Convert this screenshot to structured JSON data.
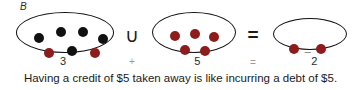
{
  "figure": {
    "set_label": "B",
    "caption": "Having a credit of $5 taken away is like incurring a debt of $5.",
    "operators": {
      "union": "∪",
      "equals": "=",
      "plus_small": "+",
      "equals_small": "="
    },
    "labels": {
      "first": "3",
      "second_sign": "¯",
      "second_value": "5",
      "result_sign": "¯",
      "result_value": "2"
    },
    "colors": {
      "black_dot": "#111111",
      "red_dot": "#8e1c1c",
      "outline": "#111111",
      "background": "#ffffff"
    },
    "sets": [
      {
        "name": "set-b",
        "label": "3",
        "black_count": 5,
        "red_count": 3,
        "dots": [
          {
            "color": "black",
            "x": 22,
            "y": 25,
            "r": 5.4
          },
          {
            "color": "black",
            "x": 44,
            "y": 19,
            "r": 5.4
          },
          {
            "color": "black",
            "x": 66,
            "y": 19,
            "r": 5.4
          },
          {
            "color": "black",
            "x": 86,
            "y": 26,
            "r": 5.4
          },
          {
            "color": "black",
            "x": 55,
            "y": 38,
            "r": 5.4
          },
          {
            "color": "red",
            "x": 32,
            "y": 40,
            "r": 5.4
          },
          {
            "color": "red",
            "x": 78,
            "y": 40,
            "r": 5.4
          },
          {
            "color": "red",
            "x": 55,
            "y": 38,
            "r": 0
          }
        ]
      },
      {
        "name": "set-negative-five",
        "label": "5",
        "black_count": 0,
        "red_count": 5,
        "dots": [
          {
            "color": "red",
            "x": 22,
            "y": 23,
            "r": 5.4
          },
          {
            "color": "red",
            "x": 42,
            "y": 21,
            "r": 5.4
          },
          {
            "color": "red",
            "x": 61,
            "y": 24,
            "r": 5.4
          },
          {
            "color": "red",
            "x": 32,
            "y": 37,
            "r": 5.4
          },
          {
            "color": "red",
            "x": 52,
            "y": 38,
            "r": 5.4
          }
        ]
      },
      {
        "name": "set-result",
        "label": "2",
        "black_count": 0,
        "red_count": 2,
        "dots": [
          {
            "color": "red",
            "x": 20,
            "y": 30,
            "r": 5.0
          },
          {
            "color": "red",
            "x": 47,
            "y": 30,
            "r": 5.0
          }
        ]
      }
    ]
  }
}
